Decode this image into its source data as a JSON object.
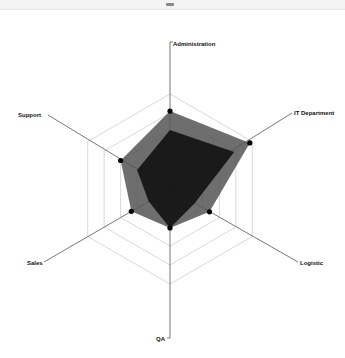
{
  "window": {
    "drag_handle": "resize-handle"
  },
  "chart_data": {
    "type": "radar",
    "title": "",
    "axes": [
      "Administration",
      "IT Department",
      "Logistic",
      "QA",
      "Sales",
      "Support"
    ],
    "range": [
      0,
      100
    ],
    "grid_levels": 5,
    "grid": true,
    "legend": "none",
    "series": [
      {
        "name": "Series 1",
        "values": [
          82,
          97,
          48,
          41,
          47,
          60
        ],
        "color": "#555555",
        "opacity": 0.85,
        "markers": true
      },
      {
        "name": "Series 2",
        "values": [
          62,
          78,
          30,
          41,
          26,
          40
        ],
        "color": "#111111",
        "opacity": 0.9,
        "markers": false
      }
    ]
  },
  "labels": {
    "administration": "Administration",
    "it_department": "IT Department",
    "logistic": "Logistic",
    "qa": "QA",
    "sales": "Sales",
    "support": "Support"
  }
}
